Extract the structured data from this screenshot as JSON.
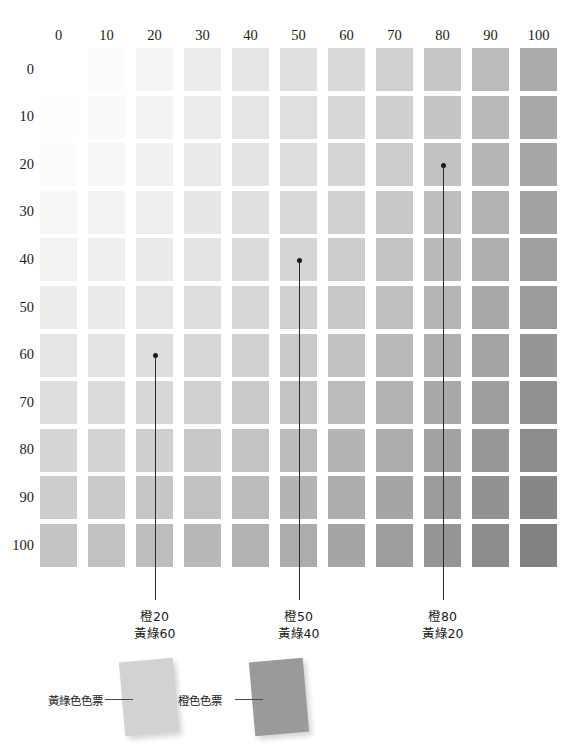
{
  "chart_data": {
    "type": "heatmap",
    "title": "",
    "xlabel": "",
    "ylabel": "",
    "x_axis_name": "橙",
    "y_axis_name": "黃綠",
    "grid": true,
    "legend_position": "bottom",
    "categories": [
      "0",
      "10",
      "20",
      "30",
      "40",
      "50",
      "60",
      "70",
      "80",
      "90",
      "100"
    ],
    "column_headers": [
      "0",
      "10",
      "20",
      "30",
      "40",
      "50",
      "60",
      "70",
      "80",
      "90",
      "100"
    ],
    "row_headers": [
      "0",
      "10",
      "20",
      "30",
      "40",
      "50",
      "60",
      "70",
      "80",
      "90",
      "100"
    ],
    "x": [
      0,
      10,
      20,
      30,
      40,
      50,
      60,
      70,
      80,
      90,
      100
    ],
    "y": [
      0,
      10,
      20,
      30,
      40,
      50,
      60,
      70,
      80,
      90,
      100
    ],
    "cell_colors": [
      [
        "#ffffff",
        "#fcfcfc",
        "#f4f4f4",
        "#ededed",
        "#e6e6e6",
        "#e0e0e0",
        "#d9d9d9",
        "#d0d0d0",
        "#c7c7c7",
        "#bbbbbb",
        "#ababab"
      ],
      [
        "#fefefe",
        "#fafafa",
        "#f3f3f3",
        "#ececec",
        "#e5e5e5",
        "#dfdfdf",
        "#d8d8d8",
        "#cfcfcf",
        "#c5c5c5",
        "#b9b9b9",
        "#a9a9a9"
      ],
      [
        "#fbfbfb",
        "#f7f7f7",
        "#f1f1f1",
        "#eaeaea",
        "#e3e3e3",
        "#dddddd",
        "#d5d5d5",
        "#cccccc",
        "#c2c2c2",
        "#b6b6b6",
        "#a7a7a7"
      ],
      [
        "#f7f7f7",
        "#f3f3f3",
        "#eeeeee",
        "#e7e7e7",
        "#e0e0e0",
        "#d9d9d9",
        "#d1d1d1",
        "#c8c8c8",
        "#bebebe",
        "#b2b2b2",
        "#a3a3a3"
      ],
      [
        "#f2f2f2",
        "#efefef",
        "#eaeaea",
        "#e3e3e3",
        "#dcdcdc",
        "#d5d5d5",
        "#cdcdcd",
        "#c4c4c4",
        "#bababa",
        "#aeaeae",
        "#9f9f9f"
      ],
      [
        "#ededed",
        "#eaeaea",
        "#e5e5e5",
        "#dedede",
        "#d7d7d7",
        "#d0d0d0",
        "#c8c8c8",
        "#bfbfbf",
        "#b5b5b5",
        "#a9a9a9",
        "#9b9b9b"
      ],
      [
        "#e6e6e6",
        "#e3e3e3",
        "#dedede",
        "#d8d8d8",
        "#d1d1d1",
        "#cacaca",
        "#c2c2c2",
        "#b9b9b9",
        "#afafaf",
        "#a4a4a4",
        "#969696"
      ],
      [
        "#dedede",
        "#dbdbdb",
        "#d7d7d7",
        "#d1d1d1",
        "#cacaca",
        "#c3c3c3",
        "#bbbbbb",
        "#b2b2b2",
        "#a9a9a9",
        "#9e9e9e",
        "#919191"
      ],
      [
        "#d6d6d6",
        "#d3d3d3",
        "#cfcfcf",
        "#c9c9c9",
        "#c3c3c3",
        "#bcbcbc",
        "#b4b4b4",
        "#acacac",
        "#a3a3a3",
        "#989898",
        "#8c8c8c"
      ],
      [
        "#cdcdcd",
        "#cacaca",
        "#c6c6c6",
        "#c1c1c1",
        "#bbbbbb",
        "#b4b4b4",
        "#adadad",
        "#a5a5a5",
        "#9c9c9c",
        "#929292",
        "#878787"
      ],
      [
        "#c4c4c4",
        "#c1c1c1",
        "#bdbdbd",
        "#b8b8b8",
        "#b2b2b2",
        "#acacac",
        "#a5a5a5",
        "#9d9d9d",
        "#959595",
        "#8c8c8c",
        "#828282"
      ]
    ],
    "annotations": [
      {
        "name": "callout-1",
        "orange": 20,
        "yellow_green": 60,
        "line1": "橙20",
        "line2": "黃綠60",
        "cell_column": 2,
        "cell_row": 6
      },
      {
        "name": "callout-2",
        "orange": 50,
        "yellow_green": 40,
        "line1": "橙50",
        "line2": "黃綠40",
        "cell_column": 5,
        "cell_row": 4
      },
      {
        "name": "callout-3",
        "orange": 80,
        "yellow_green": 20,
        "line1": "橙80",
        "line2": "黃綠20",
        "cell_column": 8,
        "cell_row": 2
      }
    ]
  },
  "swatches": [
    {
      "name": "yellow-green-swatch",
      "label": "黃綠色色票",
      "color": "#d2d2d2"
    },
    {
      "name": "orange-swatch",
      "label": "橙色色票",
      "color": "#9a9a9a"
    }
  ]
}
